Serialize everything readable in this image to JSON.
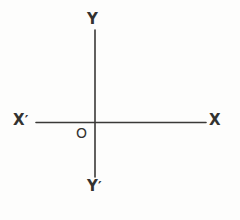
{
  "figure": {
    "type": "cartesian-axes-diagram",
    "background_color": "#fdfdfc",
    "stroke_color": "#3a3937",
    "text_color": "#333230",
    "canvas": {
      "width": 240,
      "height": 220
    },
    "origin": {
      "x": 95,
      "y": 122.5
    },
    "axes": {
      "horizontal": {
        "name": "x-axis",
        "x1": 36,
        "y1": 122.5,
        "x2": 206,
        "y2": 122.5,
        "stroke_width": 1.6
      },
      "vertical": {
        "name": "y-axis",
        "x1": 95,
        "y1": 30,
        "x2": 95,
        "y2": 177,
        "stroke_width": 1.6
      }
    },
    "labels": {
      "y_positive": "Y",
      "y_negative_letter": "Y",
      "y_negative_prime": "′",
      "x_positive": "X",
      "x_negative_letter": "X",
      "x_negative_prime": "′",
      "origin": "O"
    }
  }
}
